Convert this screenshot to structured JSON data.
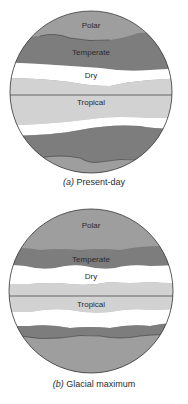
{
  "colors": {
    "polar": "#9e9e9e",
    "temperate": "#7d7d7d",
    "dry": "#ffffff",
    "tropical": "#d2d2d2",
    "outline": "#3a3a3a",
    "text": "#2a2a2a"
  },
  "panels": [
    {
      "id": "present-day",
      "caption_prefix": "(a)",
      "caption_text": "Present-day",
      "labels": {
        "polar": "Polar",
        "temperate": "Temperate",
        "dry": "Dry",
        "tropical": "Tropical"
      }
    },
    {
      "id": "glacial-maximum",
      "caption_prefix": "(b)",
      "caption_text": "Glacial maximum",
      "labels": {
        "polar": "Polar",
        "temperate": "Temperate",
        "dry": "Dry",
        "tropical": "Tropical"
      }
    }
  ]
}
